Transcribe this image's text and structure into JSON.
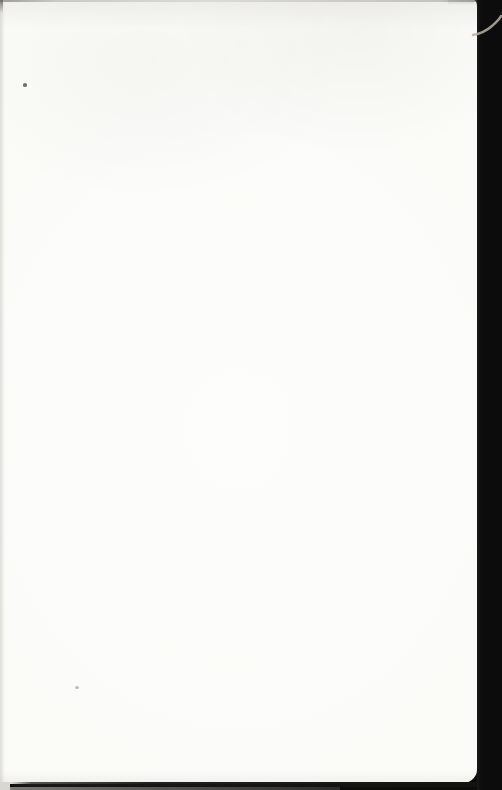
{
  "document": {
    "type": "scanned-book-page",
    "description": "Blank flyleaf page of a scanned book; no printed text or UI elements visible",
    "page_text": ""
  },
  "colors": {
    "page": "#fbfbf8",
    "scan_background": "#0c0c0c",
    "bottom_shadow_line": "#1c1c1a",
    "fiber_mark": "#b7b0a4",
    "left_edge_shading": "#c9c7c0",
    "top_edge_line": "#8c8a85",
    "speck_dark": "#504e4a",
    "speck_faint": "#8c8a84",
    "bottom_left_gap": "#d9d7d1"
  },
  "artifacts": [
    {
      "name": "scanner-background-band",
      "location": "right edge",
      "color_key": "scan_background"
    },
    {
      "name": "fiber-mark",
      "location": "top right, inside black band",
      "color_key": "fiber_mark"
    },
    {
      "name": "top-edge-shadow",
      "location": "top edge",
      "color_key": "top_edge_line"
    },
    {
      "name": "top-left-corner-mark",
      "location": "top left corner",
      "color_key": "speck_dark"
    },
    {
      "name": "left-edge-shading",
      "location": "left edge",
      "color_key": "left_edge_shading"
    },
    {
      "name": "bottom-edge-shadow",
      "location": "bottom edge",
      "color_key": "bottom_shadow_line"
    },
    {
      "name": "ink-speck",
      "location": "upper left area",
      "color_key": "speck_dark"
    },
    {
      "name": "ink-speck-faint",
      "location": "lower left area",
      "color_key": "speck_faint"
    }
  ]
}
